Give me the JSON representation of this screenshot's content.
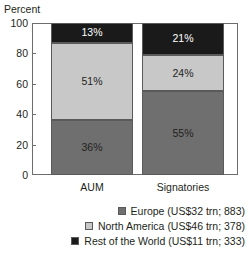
{
  "chart_data": {
    "type": "bar",
    "subtype": "stacked-bar-100",
    "title": "",
    "ylabel": "Percent",
    "xlabel": "",
    "ylim": [
      0,
      100
    ],
    "yticks": [
      0,
      20,
      40,
      60,
      80,
      100
    ],
    "ytick_labels": [
      "0",
      "20",
      "40",
      "60",
      "80",
      "100"
    ],
    "grid": false,
    "legend_position": "bottom-right",
    "categories": [
      "AUM",
      "Signatories"
    ],
    "series": [
      {
        "name": "Europe",
        "legend_label": "Europe (US$32 trn; 883)",
        "color": "#6f6f6f",
        "values": [
          36,
          55
        ],
        "data_labels": [
          "36%",
          "21%"
        ]
      },
      {
        "name": "North America",
        "legend_label": "North America (US$46 trn; 378)",
        "color": "#c8c8c8",
        "values": [
          51,
          24
        ],
        "data_labels": [
          "51%",
          "24%"
        ]
      },
      {
        "name": "Rest of the World",
        "legend_label": "Rest of the World (US$11 trn; 333)",
        "color": "#1a1a1a",
        "values": [
          13,
          21
        ],
        "data_labels": [
          "13%",
          "21%"
        ]
      }
    ],
    "bars": [
      {
        "category": "AUM",
        "segments": [
          {
            "series": "Europe",
            "value": 36,
            "label": "36%",
            "color": "#6f6f6f",
            "label_contrast": "on-light"
          },
          {
            "series": "North America",
            "value": 51,
            "label": "51%",
            "color": "#c8c8c8",
            "label_contrast": "on-light"
          },
          {
            "series": "Rest of the World",
            "value": 13,
            "label": "13%",
            "color": "#1a1a1a",
            "label_contrast": "on-dark"
          }
        ]
      },
      {
        "category": "Signatories",
        "segments": [
          {
            "series": "Europe",
            "value": 55,
            "label": "55%",
            "color": "#6f6f6f",
            "label_contrast": "on-light"
          },
          {
            "series": "North America",
            "value": 24,
            "label": "24%",
            "color": "#c8c8c8",
            "label_contrast": "on-light"
          },
          {
            "series": "Rest of the World",
            "value": 21,
            "label": "21%",
            "color": "#1a1a1a",
            "label_contrast": "on-dark"
          }
        ]
      }
    ]
  },
  "axis": {
    "ylabel": "Percent",
    "ticks": [
      {
        "value": 100,
        "label": "100"
      },
      {
        "value": 80,
        "label": "80"
      },
      {
        "value": 60,
        "label": "60"
      },
      {
        "value": 40,
        "label": "40"
      },
      {
        "value": 20,
        "label": "20"
      },
      {
        "value": 0,
        "label": "0"
      }
    ]
  },
  "legend": {
    "items": [
      {
        "label": "Europe (US$32 trn; 883)",
        "color": "#6f6f6f"
      },
      {
        "label": "North America (US$46 trn; 378)",
        "color": "#c8c8c8"
      },
      {
        "label": "Rest of the World (US$11 trn; 333)",
        "color": "#1a1a1a"
      }
    ]
  },
  "colors": {
    "europe": "#6f6f6f",
    "north_america": "#c8c8c8",
    "rest_of_world": "#1a1a1a",
    "axis": "#6d6d6d",
    "text": "#231f20",
    "background": "#ffffff"
  }
}
